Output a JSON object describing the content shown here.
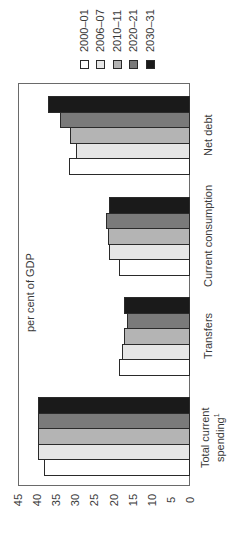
{
  "chart_data": {
    "type": "bar",
    "orientation": "rotated-90-ccw",
    "title": "",
    "ylabel": "per cent of GDP",
    "xlabel": "",
    "ylim": [
      0,
      45
    ],
    "yticks": [
      0,
      5,
      10,
      15,
      20,
      25,
      30,
      35,
      40,
      45
    ],
    "grid": false,
    "legend_position": "top",
    "categories": [
      "Total current spending¹",
      "Transfers",
      "Current consumption",
      "Net debt"
    ],
    "series": [
      {
        "name": "2000–01",
        "color": "#ffffff",
        "values": [
          38.3,
          18.5,
          18.5,
          31.7
        ]
      },
      {
        "name": "2006–07",
        "color": "#e6e6e6",
        "values": [
          39.8,
          17.7,
          21.1,
          29.8
        ]
      },
      {
        "name": "2010–11",
        "color": "#b4b4b4",
        "values": [
          39.8,
          17.2,
          21.4,
          31.4
        ]
      },
      {
        "name": "2020–21",
        "color": "#7a7a7a",
        "values": [
          39.8,
          16.4,
          21.9,
          34.0
        ]
      },
      {
        "name": "2030–31",
        "color": "#1a1a1a",
        "values": [
          39.8,
          17.2,
          21.1,
          37.2
        ]
      }
    ]
  },
  "axis": {
    "label": "per cent of GDP",
    "ticks": [
      "0",
      "5",
      "10",
      "15",
      "20",
      "25",
      "30",
      "35",
      "40",
      "45"
    ]
  },
  "legend": [
    {
      "label": "2000–01",
      "color": "#ffffff"
    },
    {
      "label": "2006–07",
      "color": "#e6e6e6"
    },
    {
      "label": "2010–11",
      "color": "#b4b4b4"
    },
    {
      "label": "2020–21",
      "color": "#7a7a7a"
    },
    {
      "label": "2030–31",
      "color": "#1a1a1a"
    }
  ],
  "categories": [
    {
      "line1": "Total current",
      "line2": "spending",
      "sup": "1"
    },
    {
      "line1": "Transfers",
      "line2": "",
      "sup": ""
    },
    {
      "line1": "Current consumption",
      "line2": "",
      "sup": ""
    },
    {
      "line1": "Net debt",
      "line2": "",
      "sup": ""
    }
  ]
}
